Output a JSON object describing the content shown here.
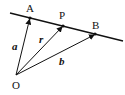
{
  "diagram": {
    "type": "vector-line",
    "line": {
      "x1": 10,
      "y1": 13,
      "x2": 123,
      "y2": 41
    },
    "origin": {
      "name": "O",
      "x": 16,
      "y": 75,
      "label_x": 12,
      "label_y": 89
    },
    "points": [
      {
        "name": "A",
        "x": 30,
        "y": 18,
        "label_x": 26,
        "label_y": 12
      },
      {
        "name": "P",
        "x": 63,
        "y": 26,
        "label_x": 59,
        "label_y": 18
      },
      {
        "name": "B",
        "x": 95,
        "y": 34,
        "label_x": 92,
        "label_y": 28
      }
    ],
    "vectors": [
      {
        "name": "a",
        "to": "A",
        "label_x": 12,
        "label_y": 50
      },
      {
        "name": "r",
        "to": "P",
        "label_x": 39,
        "label_y": 42
      },
      {
        "name": "b",
        "to": "B",
        "label_x": 59,
        "label_y": 65
      }
    ],
    "labels": {
      "O": "O",
      "A": "A",
      "P": "P",
      "B": "B",
      "a": "a",
      "r": "r",
      "b": "b"
    },
    "stroke_color": "#111111"
  }
}
